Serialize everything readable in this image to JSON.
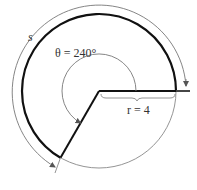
{
  "diagram": {
    "type": "arc-length-sector",
    "angle_label": "θ = 240°",
    "angle_symbol": "θ",
    "angle_value_deg": 240,
    "radius_label": "r = 4",
    "radius_value": 4,
    "arc_label": "s",
    "colors": {
      "thick_stroke": "#111111",
      "thin_stroke": "#777777",
      "text": "#333333"
    }
  }
}
